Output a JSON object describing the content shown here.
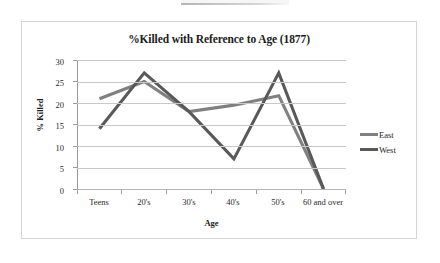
{
  "chart_data": {
    "type": "line",
    "title": "%Killed with Reference to Age (1877)",
    "xlabel": "Age",
    "ylabel": "% Killed",
    "categories": [
      "Teens",
      "20's",
      "30's",
      "40's",
      "50's",
      "60 and over"
    ],
    "series": [
      {
        "name": "East",
        "color": "#808080",
        "values": [
          21,
          25,
          18,
          19.5,
          21.7,
          0
        ]
      },
      {
        "name": "West",
        "color": "#595959",
        "values": [
          14,
          27,
          18,
          7,
          27,
          0
        ]
      }
    ],
    "ylim": [
      0,
      30
    ],
    "yticks": [
      0,
      5,
      10,
      15,
      20,
      25,
      30
    ],
    "ytick_labels": [
      "0",
      "5",
      "10",
      "15",
      "20",
      "25",
      "30"
    ],
    "grid": true,
    "legend_position": "right",
    "markers": false
  },
  "legend": {
    "entries": [
      {
        "label": "East"
      },
      {
        "label": "West"
      }
    ]
  },
  "colors": {
    "east_line": "#808080",
    "west_line": "#595959",
    "gridline": "#c8c8c8",
    "axis": "#9a9a9a",
    "frame_border": "#d5d5d5",
    "background": "#ffffff",
    "text": "#1c1c1c"
  }
}
